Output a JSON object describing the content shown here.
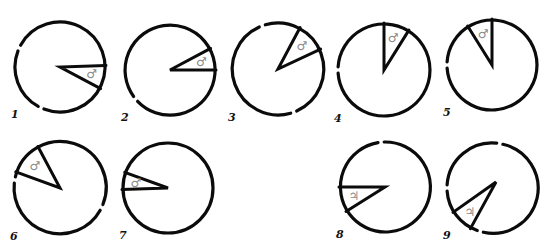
{
  "figure": {
    "symbols": {
      "mars": "♂",
      "jupiter": "♃"
    },
    "colors": {
      "ink": "#0b0b0b",
      "symbol": "#8a8a8a",
      "background": "#ffffff"
    },
    "panels": [
      {
        "label": "1",
        "cx": 60,
        "cy": 67,
        "r": 45,
        "start_deg": -2,
        "end_deg": 28,
        "apex": [
          60,
          67
        ],
        "symbol": "♂",
        "gaps": [
          115,
          205
        ]
      },
      {
        "label": "2",
        "cx": 170,
        "cy": 70,
        "r": 45,
        "start_deg": -28,
        "end_deg": 0,
        "apex": [
          170,
          70
        ],
        "symbol": "♂",
        "gaps": [
          140
        ]
      },
      {
        "label": "3",
        "cx": 278,
        "cy": 69,
        "r": 46,
        "start_deg": -62,
        "end_deg": -25,
        "apex": [
          278,
          69
        ],
        "symbol": "♂",
        "gaps": [
          -110,
          70
        ]
      },
      {
        "label": "4",
        "cx": 384,
        "cy": 70,
        "r": 46,
        "start_deg": -90,
        "end_deg": -58,
        "apex": [
          384,
          70
        ],
        "symbol": "♂",
        "gaps": [
          180
        ]
      },
      {
        "label": "5",
        "cx": 492,
        "cy": 65,
        "r": 45,
        "start_deg": -122,
        "end_deg": -90,
        "apex": [
          492,
          65
        ],
        "symbol": "♂",
        "gaps": [
          180
        ]
      },
      {
        "label": "6",
        "cx": 60,
        "cy": 188,
        "r": 46,
        "start_deg": -160,
        "end_deg": -118,
        "apex": [
          60,
          188
        ],
        "symbol": "♂",
        "gaps": [
          -170,
          25
        ]
      },
      {
        "label": "7",
        "cx": 168,
        "cy": 188,
        "r": 45,
        "start_deg": -160,
        "end_deg": 178,
        "apex": [
          168,
          188
        ],
        "symbol": "♂",
        "gaps": []
      },
      {
        "label": "8",
        "cx": 385,
        "cy": 187,
        "r": 45,
        "start_deg": 148,
        "end_deg": 180,
        "apex": [
          385,
          187
        ],
        "symbol": "♃",
        "gaps": [
          -95
        ]
      },
      {
        "label": "9",
        "cx": 492,
        "cy": 188,
        "r": 45,
        "start_deg": 118,
        "end_deg": 148,
        "apex": [
          496,
          182
        ],
        "symbol": "♃",
        "gaps": [
          -80,
          105,
          180
        ]
      }
    ]
  }
}
